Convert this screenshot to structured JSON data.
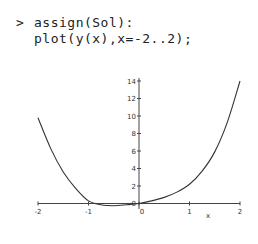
{
  "worksheet": {
    "prompt_symbol": ">",
    "input_lines": [
      "assign(Sol):",
      "plot(y(x),x=-2..2);"
    ]
  },
  "chart_data": {
    "type": "line",
    "title": "",
    "xlabel": "x",
    "ylabel": "",
    "xlim": [
      -2,
      2
    ],
    "ylim": [
      -0.5,
      14
    ],
    "x_ticks": [
      "-2",
      "-1",
      "0",
      "1",
      "2"
    ],
    "y_ticks": [
      "0",
      "2",
      "4",
      "6",
      "8",
      "10",
      "12",
      "14"
    ],
    "grid": false,
    "legend": null,
    "series": [
      {
        "name": "y(x)",
        "x": [
          -2,
          -1.75,
          -1.5,
          -1.25,
          -1,
          -0.75,
          -0.5,
          -0.25,
          0,
          0.25,
          0.5,
          0.75,
          1,
          1.25,
          1.5,
          1.75,
          2
        ],
        "values": [
          9.8,
          6.3,
          3.6,
          1.7,
          0.3,
          -0.15,
          -0.25,
          -0.15,
          0,
          0.3,
          0.7,
          1.3,
          2.2,
          3.7,
          5.9,
          9.3,
          14
        ]
      }
    ],
    "color": "#333333"
  }
}
